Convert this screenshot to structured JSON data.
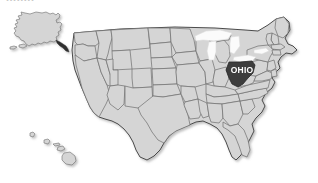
{
  "figure": {
    "type": "choropleth-locator-map",
    "region": "United States",
    "title_fragment": "........",
    "background_color": "#ffffff"
  },
  "map": {
    "state_fill": "#d5d5d5",
    "state_border": "#6e6e6e",
    "outer_border": "#4a4a4a",
    "lake_fill": "#fbfbfb",
    "highlight_fill": "#3c3c3c",
    "highlight_label_color": "#ffffff",
    "shadow": "drop-shadow"
  },
  "highlight": {
    "label": "OHIO",
    "state_name": "Ohio",
    "fill": "#3c3c3c"
  },
  "insets": [
    {
      "name": "alaska",
      "label": ""
    },
    {
      "name": "hawaii",
      "label": ""
    }
  ],
  "water_bodies": [
    {
      "name": "lake-superior"
    },
    {
      "name": "lake-michigan"
    },
    {
      "name": "lake-huron"
    },
    {
      "name": "lake-erie"
    },
    {
      "name": "lake-ontario"
    }
  ]
}
